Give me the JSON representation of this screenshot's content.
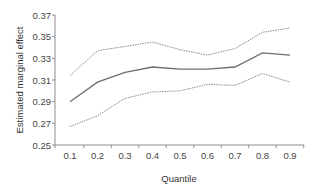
{
  "chart_data": {
    "type": "line",
    "title": "",
    "xlabel": "Quantile",
    "ylabel": "Estimated marginal effect",
    "x": [
      0.1,
      0.2,
      0.3,
      0.4,
      0.5,
      0.6,
      0.7,
      0.8,
      0.9
    ],
    "x_tick_labels": [
      "0.1",
      "0.2",
      "0.3",
      "0.4",
      "0.5",
      "0.6",
      "0.7",
      "0.8",
      "0.9"
    ],
    "y_tick_labels": [
      "0.25",
      "0.27",
      "0.29",
      "0.31",
      "0.33",
      "0.35",
      "0.37"
    ],
    "y_ticks": [
      0.25,
      0.27,
      0.29,
      0.31,
      0.33,
      0.35,
      0.37
    ],
    "ylim": [
      0.25,
      0.37
    ],
    "grid": false,
    "legend": null,
    "series": [
      {
        "name": "Upper bound",
        "style": "dotted",
        "color": "#8a8a8a",
        "values": [
          0.314,
          0.337,
          0.341,
          0.345,
          0.338,
          0.333,
          0.339,
          0.354,
          0.358
        ]
      },
      {
        "name": "Estimate",
        "style": "solid",
        "color": "#6e6e6e",
        "values": [
          0.29,
          0.308,
          0.317,
          0.322,
          0.32,
          0.32,
          0.322,
          0.335,
          0.333
        ]
      },
      {
        "name": "Lower bound",
        "style": "dotted",
        "color": "#8a8a8a",
        "values": [
          0.267,
          0.277,
          0.293,
          0.299,
          0.3,
          0.306,
          0.305,
          0.316,
          0.308
        ]
      }
    ]
  },
  "layout": {
    "axis_color": "#8c8c8c"
  }
}
